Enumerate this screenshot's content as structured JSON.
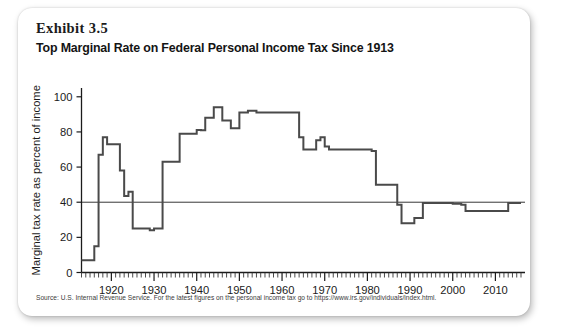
{
  "card": {
    "exhibit_label": "Exhibit 3.5",
    "title": "Top Marginal Rate on Federal Personal Income Tax Since 1913",
    "source_note": "Source: U.S. Internal Revenue Service. For the latest figures on the personal income tax go to https://www.irs.gov/individuals/index.html."
  },
  "colors": {
    "line": "#4a4a4a",
    "axis": "#1b1b1b",
    "reference_line": "#1f1f1f",
    "background": "#ffffff",
    "text": "#141414"
  },
  "chart_data": {
    "type": "line",
    "title": "Top Marginal Rate on Federal Personal Income Tax Since 1913",
    "xlabel": "",
    "ylabel": "Marginal tax rate as percent of income",
    "xlim": [
      1913,
      2016
    ],
    "ylim": [
      0,
      110
    ],
    "grid": false,
    "legend": null,
    "y_ticks": [
      0,
      20,
      40,
      60,
      80,
      100
    ],
    "y_tick_labels": [
      "0",
      "20",
      "40",
      "60",
      "80",
      "100"
    ],
    "x_ticks": [
      1920,
      1930,
      1940,
      1950,
      1960,
      1970,
      1980,
      1990,
      2000,
      2010
    ],
    "x_tick_labels": [
      "1920",
      "1930",
      "1940",
      "1950",
      "1960",
      "1970",
      "1980",
      "1990",
      "2000",
      "2010"
    ],
    "x_minor_tick_step": 1,
    "reference_line_y": 40,
    "series": [
      {
        "name": "Top marginal federal personal income tax rate",
        "x": [
          1913,
          1914,
          1915,
          1916,
          1917,
          1918,
          1919,
          1920,
          1921,
          1922,
          1923,
          1924,
          1925,
          1926,
          1927,
          1928,
          1929,
          1930,
          1931,
          1932,
          1933,
          1934,
          1935,
          1936,
          1937,
          1938,
          1939,
          1940,
          1941,
          1942,
          1943,
          1944,
          1945,
          1946,
          1947,
          1948,
          1949,
          1950,
          1951,
          1952,
          1953,
          1954,
          1955,
          1956,
          1957,
          1958,
          1959,
          1960,
          1961,
          1962,
          1963,
          1964,
          1965,
          1966,
          1967,
          1968,
          1969,
          1970,
          1971,
          1972,
          1973,
          1974,
          1975,
          1976,
          1977,
          1978,
          1979,
          1980,
          1981,
          1982,
          1983,
          1984,
          1985,
          1986,
          1987,
          1988,
          1989,
          1990,
          1991,
          1992,
          1993,
          1994,
          1995,
          1996,
          1997,
          1998,
          1999,
          2000,
          2001,
          2002,
          2003,
          2004,
          2005,
          2006,
          2007,
          2008,
          2009,
          2010,
          2011,
          2012,
          2013,
          2014,
          2015,
          2016
        ],
        "values": [
          7,
          7,
          7,
          15,
          67,
          77,
          73,
          73,
          73,
          58,
          43.5,
          46,
          25,
          25,
          25,
          25,
          24,
          25,
          25,
          63,
          63,
          63,
          63,
          79,
          79,
          79,
          79,
          81.1,
          81,
          88,
          88,
          94,
          94,
          86.45,
          86.45,
          82.13,
          82.13,
          91,
          91,
          92,
          92,
          91,
          91,
          91,
          91,
          91,
          91,
          91,
          91,
          91,
          91,
          77,
          70,
          70,
          70,
          75.25,
          77,
          71.75,
          70,
          70,
          70,
          70,
          70,
          70,
          70,
          70,
          70,
          70,
          69.125,
          50,
          50,
          50,
          50,
          50,
          38.5,
          28,
          28,
          28,
          31,
          31,
          39.6,
          39.6,
          39.6,
          39.6,
          39.6,
          39.6,
          39.6,
          39.1,
          39.1,
          38.6,
          35,
          35,
          35,
          35,
          35,
          35,
          35,
          35,
          35,
          35,
          39.6,
          39.6,
          39.6,
          39.6
        ]
      }
    ],
    "annotations": [
      {
        "label": "Peak rate 94% during World War II",
        "x": 1944,
        "y": 94
      },
      {
        "label": "Reference line at 40 percent",
        "y": 40
      }
    ]
  }
}
